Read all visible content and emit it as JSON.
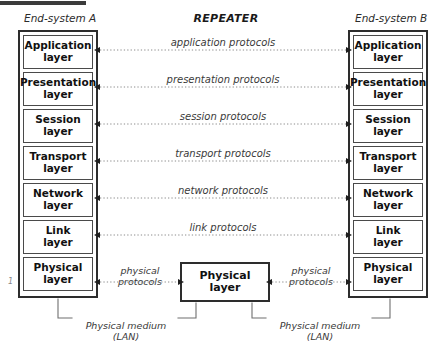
{
  "diagram": {
    "title_repeater": "REPEATER",
    "caption_left": "End-system A",
    "caption_right": "End-system B",
    "left_margin_mark": "1",
    "colors": {
      "line": "#2d2d2d",
      "inner_border": "#4a4a4a",
      "text": "#111111",
      "label_text": "#3a3a3a",
      "dotted": "#8a8a8a",
      "top_rule": "#3b3b3b"
    },
    "layers": [
      {
        "line1": "Application",
        "line2": "layer"
      },
      {
        "line1": "Presentation",
        "line2": "layer"
      },
      {
        "line1": "Session",
        "line2": "layer"
      },
      {
        "line1": "Transport",
        "line2": "layer"
      },
      {
        "line1": "Network",
        "line2": "layer"
      },
      {
        "line1": "Link",
        "line2": "layer"
      },
      {
        "line1": "Physical",
        "line2": "layer"
      }
    ],
    "repeater_layer": {
      "line1": "Physical",
      "line2": "layer"
    },
    "protocols": [
      "application protocols",
      "presentation protocols",
      "session protocols",
      "transport protocols",
      "network protocols",
      "link protocols"
    ],
    "physical_protocol_left": {
      "line1": "physical",
      "line2": "protocols"
    },
    "physical_protocol_right": {
      "line1": "physical",
      "line2": "protocols"
    },
    "medium_left": {
      "line1": "Physical medium",
      "line2": "(LAN)"
    },
    "medium_right": {
      "line1": "Physical medium",
      "line2": "(LAN)"
    }
  }
}
